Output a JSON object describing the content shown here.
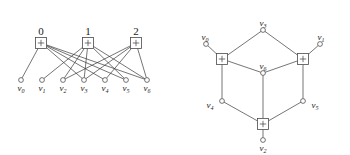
{
  "figure": {
    "stroke_color": "#3a3a3a",
    "node_fill": "#ffffff",
    "background": "#ffffff"
  },
  "left_panel": {
    "name": "bipartite-factor-graph",
    "check_nodes": [
      {
        "id": "c0",
        "label": "0",
        "glyph": "+",
        "x": 41,
        "y": 43
      },
      {
        "id": "c1",
        "label": "1",
        "glyph": "+",
        "x": 88,
        "y": 43
      },
      {
        "id": "c2",
        "label": "2",
        "glyph": "+",
        "x": 136,
        "y": 43
      }
    ],
    "variable_nodes": [
      {
        "id": "v0",
        "label": "v",
        "sub": "0",
        "x": 21,
        "y": 80
      },
      {
        "id": "v1",
        "label": "v",
        "sub": "1",
        "x": 42,
        "y": 80
      },
      {
        "id": "v2",
        "label": "v",
        "sub": "2",
        "x": 63,
        "y": 80
      },
      {
        "id": "v3",
        "label": "v",
        "sub": "3",
        "x": 84,
        "y": 80
      },
      {
        "id": "v4",
        "label": "v",
        "sub": "4",
        "x": 105,
        "y": 80
      },
      {
        "id": "v5",
        "label": "v",
        "sub": "5",
        "x": 126,
        "y": 80
      },
      {
        "id": "v6",
        "label": "v",
        "sub": "6",
        "x": 147,
        "y": 80
      }
    ],
    "edges": [
      {
        "from": "c0",
        "to": "v0"
      },
      {
        "from": "c0",
        "to": "v3"
      },
      {
        "from": "c0",
        "to": "v4"
      },
      {
        "from": "c0",
        "to": "v5"
      },
      {
        "from": "c0",
        "to": "v6"
      },
      {
        "from": "c1",
        "to": "v1"
      },
      {
        "from": "c1",
        "to": "v3"
      },
      {
        "from": "c1",
        "to": "v2"
      },
      {
        "from": "c1",
        "to": "v5"
      },
      {
        "from": "c1",
        "to": "v6"
      },
      {
        "from": "c2",
        "to": "v2"
      },
      {
        "from": "c2",
        "to": "v3"
      },
      {
        "from": "c2",
        "to": "v4"
      },
      {
        "from": "c2",
        "to": "v6"
      }
    ]
  },
  "right_panel": {
    "name": "cube-drawing",
    "check_nodes": [
      {
        "id": "r0",
        "glyph": "+",
        "x": 222,
        "y": 59
      },
      {
        "id": "r1",
        "glyph": "+",
        "x": 303,
        "y": 59
      },
      {
        "id": "r2",
        "glyph": "+",
        "x": 263,
        "y": 124
      }
    ],
    "variable_nodes": [
      {
        "id": "v0",
        "label": "v",
        "sub": "0",
        "x": 206,
        "y": 44
      },
      {
        "id": "v1",
        "label": "v",
        "sub": "1",
        "x": 320,
        "y": 44
      },
      {
        "id": "v2",
        "label": "v",
        "sub": "2",
        "x": 263,
        "y": 140
      },
      {
        "id": "v3",
        "label": "v",
        "sub": "3",
        "x": 263,
        "y": 30
      },
      {
        "id": "v4",
        "label": "v",
        "sub": "4",
        "x": 222,
        "y": 101
      },
      {
        "id": "v5",
        "label": "v",
        "sub": "5",
        "x": 303,
        "y": 101
      },
      {
        "id": "v6",
        "label": "v",
        "sub": "6",
        "x": 263,
        "y": 73
      }
    ],
    "edges": [
      {
        "from": "r0",
        "to": "v0"
      },
      {
        "from": "r0",
        "to": "v3"
      },
      {
        "from": "r0",
        "to": "v6"
      },
      {
        "from": "r0",
        "to": "v4"
      },
      {
        "from": "r1",
        "to": "v1"
      },
      {
        "from": "r1",
        "to": "v3"
      },
      {
        "from": "r1",
        "to": "v6"
      },
      {
        "from": "r1",
        "to": "v5"
      },
      {
        "from": "r2",
        "to": "v2"
      },
      {
        "from": "r2",
        "to": "v4"
      },
      {
        "from": "r2",
        "to": "v5"
      },
      {
        "from": "r2",
        "to": "v6"
      }
    ]
  }
}
